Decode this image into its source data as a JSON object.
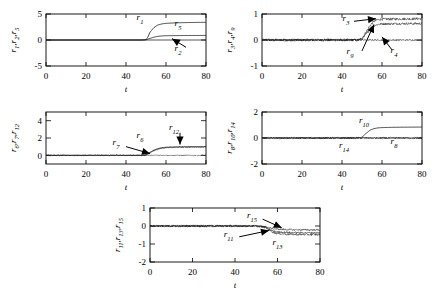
{
  "figure": {
    "xlabel": "t",
    "xticks": [
      "0",
      "20",
      "40",
      "60",
      "80"
    ],
    "xlim": [
      0,
      80
    ]
  },
  "chart_data": [
    {
      "type": "line",
      "panel": "top-left",
      "ylabel": "r_1,r_2,r_5",
      "ylabel_parts": [
        {
          "base": "r",
          "sub": "1"
        },
        {
          "base": "r",
          "sub": "2"
        },
        {
          "base": "r",
          "sub": "5"
        }
      ],
      "xlabel": "t",
      "xlim": [
        0,
        80
      ],
      "ylim": [
        -5,
        5
      ],
      "yticks": [
        -5,
        0,
        5
      ],
      "ytick_labels": [
        "-5",
        "0",
        "5"
      ],
      "xticks": [
        0,
        20,
        40,
        60,
        80
      ],
      "grid": false,
      "legend": "none",
      "annotations": [
        {
          "label": "r_1",
          "base": "r",
          "sub": "1",
          "x": 47,
          "y": 3.9
        },
        {
          "label": "r_5",
          "base": "r",
          "sub": "5",
          "x": 66,
          "y": 2.6
        },
        {
          "label": "r_2",
          "base": "r",
          "sub": "2",
          "x": 66,
          "y": -2.1
        }
      ],
      "arrows": [
        {
          "from_x": 70,
          "from_y": -1.4,
          "to_x": 63,
          "to_y": 0.25
        }
      ],
      "series": [
        {
          "name": "r_1",
          "x": [
            0,
            10,
            20,
            30,
            40,
            48,
            50,
            51,
            52,
            54,
            56,
            58,
            60,
            65,
            70,
            75,
            80
          ],
          "values": [
            0,
            0,
            0,
            0,
            0,
            0,
            0.05,
            0.6,
            1.5,
            2.4,
            2.9,
            3.1,
            3.2,
            3.3,
            3.35,
            3.38,
            3.4
          ]
        },
        {
          "name": "r_5",
          "x": [
            0,
            10,
            20,
            30,
            40,
            48,
            50,
            52,
            54,
            56,
            58,
            60,
            65,
            70,
            75,
            80
          ],
          "values": [
            0,
            0,
            0,
            0,
            0,
            0,
            0.05,
            0.3,
            0.55,
            0.7,
            0.78,
            0.82,
            0.85,
            0.86,
            0.87,
            0.88
          ]
        },
        {
          "name": "r_2",
          "x": [
            0,
            20,
            40,
            60,
            80
          ],
          "values": [
            0,
            0,
            0,
            0,
            0
          ]
        }
      ]
    },
    {
      "type": "line",
      "panel": "top-right",
      "ylabel": "r_3,r_4,r_9",
      "ylabel_parts": [
        {
          "base": "r",
          "sub": "3"
        },
        {
          "base": "r",
          "sub": "4"
        },
        {
          "base": "r",
          "sub": "9"
        }
      ],
      "xlabel": "t",
      "xlim": [
        0,
        80
      ],
      "ylim": [
        -1,
        1
      ],
      "yticks": [
        -1,
        0,
        1
      ],
      "ytick_labels": [
        "-1",
        "0",
        "1"
      ],
      "xticks": [
        0,
        20,
        40,
        60,
        80
      ],
      "grid": false,
      "legend": "none",
      "annotations": [
        {
          "label": "r_3",
          "base": "r",
          "sub": "3",
          "x": 42,
          "y": 0.72
        },
        {
          "label": "r_9",
          "base": "r",
          "sub": "9",
          "x": 44,
          "y": -0.52
        },
        {
          "label": "r_4",
          "base": "r",
          "sub": "4",
          "x": 66,
          "y": -0.5
        }
      ],
      "arrows": [
        {
          "from_x": 46,
          "from_y": 0.72,
          "to_x": 57,
          "to_y": 0.82
        },
        {
          "from_x": 50,
          "from_y": -0.42,
          "to_x": 56,
          "to_y": 0.6
        },
        {
          "from_x": 65,
          "from_y": -0.38,
          "to_x": 60,
          "to_y": 0.12
        }
      ],
      "series": [
        {
          "name": "r_3",
          "x": [
            0,
            10,
            20,
            30,
            40,
            48,
            50,
            52,
            54,
            56,
            58,
            60,
            70,
            80
          ],
          "values": [
            0,
            0,
            0,
            0,
            0,
            0,
            0.05,
            0.3,
            0.55,
            0.72,
            0.78,
            0.8,
            0.81,
            0.82
          ],
          "noise": 0.05
        },
        {
          "name": "r_9",
          "x": [
            0,
            10,
            20,
            30,
            40,
            48,
            50,
            52,
            54,
            56,
            58,
            60,
            70,
            80
          ],
          "values": [
            0,
            0,
            0,
            0,
            0,
            0,
            0.04,
            0.22,
            0.42,
            0.55,
            0.6,
            0.62,
            0.63,
            0.63
          ],
          "noise": 0.045
        },
        {
          "name": "r_4",
          "x": [
            0,
            20,
            40,
            60,
            80
          ],
          "values": [
            0,
            0,
            0,
            0,
            0
          ],
          "noise": 0.03
        }
      ]
    },
    {
      "type": "line",
      "panel": "middle-left",
      "ylabel": "r_6,r_7,r_12",
      "ylabel_parts": [
        {
          "base": "r",
          "sub": "6"
        },
        {
          "base": "r",
          "sub": "7"
        },
        {
          "base": "r",
          "sub": "12"
        }
      ],
      "xlabel": "t",
      "xlim": [
        0,
        80
      ],
      "ylim": [
        -1,
        5
      ],
      "yticks": [
        0,
        2,
        4
      ],
      "ytick_labels": [
        "0",
        "2",
        "4"
      ],
      "xticks": [
        0,
        20,
        40,
        60,
        80
      ],
      "grid": false,
      "legend": "none",
      "annotations": [
        {
          "label": "r_6",
          "base": "r",
          "sub": "6",
          "x": 47,
          "y": 1.95
        },
        {
          "label": "r_12",
          "base": "r",
          "sub": "12",
          "x": 64,
          "y": 2.9
        },
        {
          "label": "r_7",
          "base": "r",
          "sub": "7",
          "x": 35,
          "y": 1.15
        }
      ],
      "arrows": [
        {
          "from_x": 40,
          "from_y": 1.0,
          "to_x": 52,
          "to_y": 0.2
        },
        {
          "from_x": 67,
          "from_y": 2.6,
          "to_x": 67,
          "to_y": 1.25
        }
      ],
      "series": [
        {
          "name": "r_6",
          "x": [
            0,
            10,
            20,
            30,
            40,
            48,
            50,
            52,
            54,
            56,
            58,
            60,
            65,
            70,
            80
          ],
          "values": [
            0,
            0,
            0,
            0,
            0,
            0,
            0.05,
            0.35,
            0.6,
            0.78,
            0.88,
            0.93,
            0.97,
            0.99,
            1.0
          ]
        },
        {
          "name": "r_12",
          "x": [
            0,
            10,
            20,
            30,
            40,
            48,
            50,
            52,
            54,
            56,
            58,
            60,
            65,
            70,
            80
          ],
          "values": [
            0,
            0,
            0,
            0,
            0,
            0,
            0.04,
            0.3,
            0.55,
            0.72,
            0.82,
            0.88,
            0.93,
            0.95,
            0.96
          ],
          "noise": 0.06
        },
        {
          "name": "r_7",
          "x": [
            0,
            20,
            40,
            60,
            80
          ],
          "values": [
            0,
            0,
            0,
            0,
            0
          ],
          "noise": 0.05
        }
      ]
    },
    {
      "type": "line",
      "panel": "middle-right",
      "ylabel": "r_8,r_10,r_14",
      "ylabel_parts": [
        {
          "base": "r",
          "sub": "8"
        },
        {
          "base": "r",
          "sub": "10"
        },
        {
          "base": "r",
          "sub": "14"
        }
      ],
      "xlabel": "t",
      "xlim": [
        0,
        80
      ],
      "ylim": [
        -2,
        2
      ],
      "yticks": [
        -2,
        0,
        2
      ],
      "ytick_labels": [
        "-2",
        "0",
        "2"
      ],
      "xticks": [
        0,
        20,
        40,
        60,
        80
      ],
      "grid": false,
      "legend": "none",
      "annotations": [
        {
          "label": "r_10",
          "base": "r",
          "sub": "10",
          "x": 51,
          "y": 1.15
        },
        {
          "label": "r_14",
          "base": "r",
          "sub": "14",
          "x": 41,
          "y": -0.75
        },
        {
          "label": "r_8",
          "base": "r",
          "sub": "8",
          "x": 66,
          "y": -0.45
        }
      ],
      "arrows": [],
      "series": [
        {
          "name": "r_10",
          "x": [
            0,
            10,
            20,
            30,
            40,
            48,
            50,
            52,
            54,
            56,
            58,
            60,
            65,
            70,
            80
          ],
          "values": [
            0,
            0,
            0,
            0,
            0,
            0,
            0.06,
            0.35,
            0.6,
            0.72,
            0.78,
            0.8,
            0.82,
            0.83,
            0.84
          ]
        },
        {
          "name": "r_8",
          "x": [
            0,
            20,
            40,
            60,
            80
          ],
          "values": [
            0,
            0,
            0,
            0,
            0
          ],
          "noise": 0.07
        },
        {
          "name": "r_14",
          "x": [
            0,
            20,
            40,
            60,
            80
          ],
          "values": [
            0,
            0,
            0,
            0,
            0
          ],
          "noise": 0.05
        }
      ]
    },
    {
      "type": "line",
      "panel": "bottom-center",
      "ylabel": "r_11,r_13,r_15",
      "ylabel_parts": [
        {
          "base": "r",
          "sub": "11"
        },
        {
          "base": "r",
          "sub": "13"
        },
        {
          "base": "r",
          "sub": "15"
        }
      ],
      "xlabel": "t",
      "xlim": [
        0,
        80
      ],
      "ylim": [
        -2,
        1
      ],
      "yticks": [
        -2,
        -1,
        0,
        1
      ],
      "ytick_labels": [
        "-2",
        "-1",
        "0",
        "1"
      ],
      "xticks": [
        0,
        20,
        40,
        60,
        80
      ],
      "grid": false,
      "legend": "none",
      "annotations": [
        {
          "label": "r_15",
          "base": "r",
          "sub": "15",
          "x": 48,
          "y": 0.45
        },
        {
          "label": "r_11",
          "base": "r",
          "sub": "11",
          "x": 37,
          "y": -0.62
        },
        {
          "label": "r_13",
          "base": "r",
          "sub": "13",
          "x": 60,
          "y": -1.05
        }
      ],
      "arrows": [
        {
          "from_x": 53,
          "from_y": 0.38,
          "to_x": 62,
          "to_y": -0.1
        },
        {
          "from_x": 42,
          "from_y": -0.6,
          "to_x": 56,
          "to_y": -0.25
        }
      ],
      "series": [
        {
          "name": "r_15",
          "x": [
            0,
            10,
            20,
            30,
            40,
            50,
            54,
            56,
            58,
            60,
            65,
            70,
            80
          ],
          "values": [
            0,
            0,
            0,
            0,
            0,
            0,
            -0.03,
            -0.1,
            -0.15,
            -0.18,
            -0.2,
            -0.21,
            -0.22
          ],
          "noise": 0.05
        },
        {
          "name": "r_11",
          "x": [
            0,
            10,
            20,
            30,
            40,
            50,
            54,
            56,
            58,
            60,
            65,
            70,
            80
          ],
          "values": [
            0,
            0,
            0,
            0,
            0,
            0,
            -0.05,
            -0.18,
            -0.28,
            -0.33,
            -0.36,
            -0.37,
            -0.38
          ],
          "noise": 0.05
        },
        {
          "name": "r_13",
          "x": [
            0,
            10,
            20,
            30,
            40,
            50,
            54,
            56,
            58,
            60,
            65,
            70,
            80
          ],
          "values": [
            0,
            0,
            0,
            0,
            0,
            0,
            -0.06,
            -0.22,
            -0.35,
            -0.42,
            -0.46,
            -0.47,
            -0.48
          ],
          "noise": 0.06
        }
      ]
    }
  ]
}
